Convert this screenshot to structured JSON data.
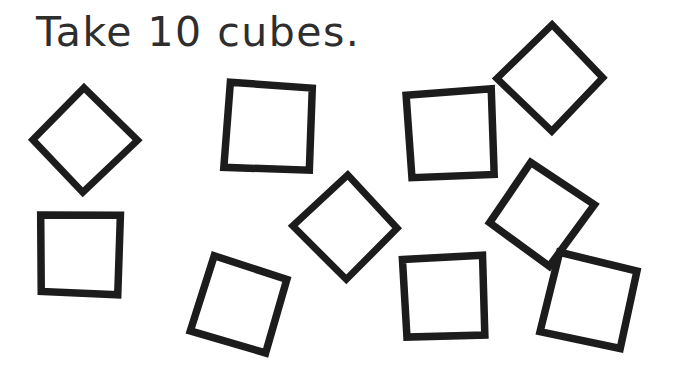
{
  "page": {
    "background_color": "#ffffff",
    "ink_color": "#1c1c1c",
    "text_color": "#2e2e2e",
    "width": 678,
    "height": 380
  },
  "instruction": {
    "text": "Take 10 cubes.",
    "quantity": 10,
    "object_name": "cubes"
  },
  "shapes": {
    "count": 10,
    "kind": "square",
    "items": [
      {
        "id": "square-1",
        "label": "square 1",
        "cx": 84,
        "cy": 140,
        "side": 74,
        "rotation": 45,
        "stroke_width": 7
      },
      {
        "id": "square-2",
        "label": "square 2",
        "cx": 269,
        "cy": 127,
        "side": 84,
        "rotation": 3,
        "stroke_width": 7.5
      },
      {
        "id": "square-3",
        "label": "square 3",
        "cx": 451,
        "cy": 134,
        "side": 84,
        "rotation": -3,
        "stroke_width": 7.5
      },
      {
        "id": "square-4",
        "label": "square 4",
        "cx": 551,
        "cy": 78,
        "side": 75,
        "rotation": 45,
        "stroke_width": 7
      },
      {
        "id": "square-5",
        "label": "square 5",
        "cx": 80,
        "cy": 254,
        "side": 78,
        "rotation": 1,
        "stroke_width": 7.5
      },
      {
        "id": "square-6",
        "label": "square 6",
        "cx": 346,
        "cy": 227,
        "side": 74,
        "rotation": 46,
        "stroke_width": 7
      },
      {
        "id": "square-7",
        "label": "square 7",
        "cx": 541,
        "cy": 214,
        "side": 75,
        "rotation": 35,
        "stroke_width": 7.5
      },
      {
        "id": "square-8",
        "label": "square 8",
        "cx": 239,
        "cy": 305,
        "side": 78,
        "rotation": 17,
        "stroke_width": 7.5
      },
      {
        "id": "square-9",
        "label": "square 9",
        "cx": 444,
        "cy": 297,
        "side": 79,
        "rotation": -2,
        "stroke_width": 7.5
      },
      {
        "id": "square-10",
        "label": "square 10",
        "cx": 589,
        "cy": 301,
        "side": 80,
        "rotation": 13,
        "stroke_width": 7.5
      }
    ]
  }
}
